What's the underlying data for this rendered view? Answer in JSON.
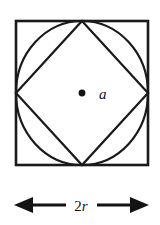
{
  "figure": {
    "background_color": "#ffffff",
    "stroke_color": "#1a1a1a",
    "shapes": {
      "square": {
        "name": "outer-square",
        "x": 16,
        "y": 21,
        "width": 132,
        "height": 144,
        "stroke_width": 2.6
      },
      "circle": {
        "name": "inscribed-circle",
        "cx": 82,
        "cy": 93,
        "rx": 66,
        "ry": 72,
        "stroke_width": 2.2
      },
      "diamond": {
        "name": "inscribed-diamond",
        "points": "82,21 148,93 82,165 16,93",
        "stroke_width": 2.2
      }
    },
    "center_point": {
      "name": "center-point",
      "cx": 82,
      "cy": 93,
      "r": 3.4,
      "color": "#131313"
    },
    "center_label": {
      "text": "a",
      "x": 99,
      "y": 99
    },
    "dimension": {
      "label_number": "2",
      "label_variable": "r",
      "label_full": "2r",
      "label_x": 80,
      "label_y": 211,
      "axis_y": 205,
      "left_tip_x": 14,
      "right_tip_x": 149,
      "left_line_start": 31,
      "left_line_end": 66,
      "right_line_start": 97,
      "right_line_end": 132,
      "head_length": 17,
      "head_half_height": 8
    }
  }
}
